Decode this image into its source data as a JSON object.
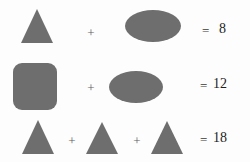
{
  "puzzle": {
    "title": "Shape equation puzzle",
    "shape_fill_color": "#6e6e6e",
    "background_color": "#fdfdfd",
    "text_color": "#1e1e1e",
    "operator_symbol": "+",
    "equals_symbol": "=",
    "rows": [
      {
        "id": "row-0",
        "terms": [
          {
            "shape": "triangle",
            "name": "triangle-shape"
          },
          {
            "shape": "ellipse",
            "name": "ellipse-shape"
          }
        ],
        "operators": [
          "+"
        ],
        "equals": "=",
        "result": "8"
      },
      {
        "id": "row-1",
        "terms": [
          {
            "shape": "rounded-square",
            "name": "rounded-square-shape"
          },
          {
            "shape": "ellipse",
            "name": "ellipse-shape"
          }
        ],
        "operators": [
          "+"
        ],
        "equals": "=",
        "result": "12"
      },
      {
        "id": "row-2",
        "terms": [
          {
            "shape": "triangle",
            "name": "triangle-shape"
          },
          {
            "shape": "triangle",
            "name": "triangle-shape"
          },
          {
            "shape": "triangle",
            "name": "triangle-shape"
          }
        ],
        "operators": [
          "+",
          "+"
        ],
        "equals": "=",
        "result": "18"
      }
    ]
  }
}
